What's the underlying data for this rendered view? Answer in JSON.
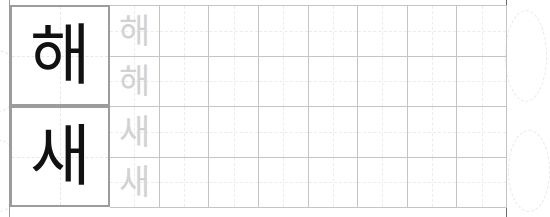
{
  "worksheet": {
    "type": "hangul-handwriting-practice",
    "columns_per_row": 8,
    "trace_rows_per_character": 2,
    "rows": [
      {
        "character": "해",
        "trace_lines": [
          [
            "해",
            "",
            "",
            "",
            "",
            "",
            "",
            ""
          ],
          [
            "해",
            "",
            "",
            "",
            "",
            "",
            "",
            ""
          ]
        ]
      },
      {
        "character": "새",
        "trace_lines": [
          [
            "새",
            "",
            "",
            "",
            "",
            "",
            "",
            ""
          ],
          [
            "새",
            "",
            "",
            "",
            "",
            "",
            "",
            ""
          ]
        ]
      }
    ]
  },
  "colors": {
    "main_char": "#111111",
    "trace_char": "#d2d2d2",
    "box_border": "#9c9c9c",
    "grid_line": "#c4c4c4"
  }
}
